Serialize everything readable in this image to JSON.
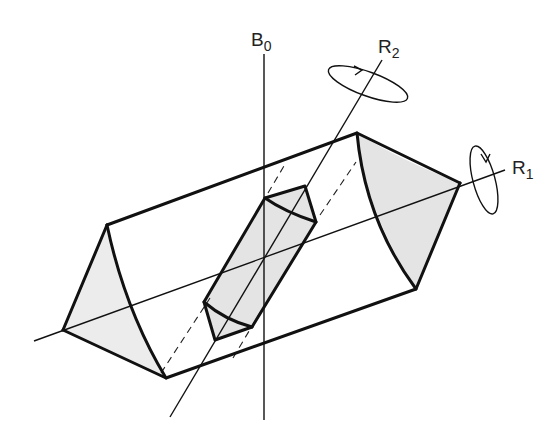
{
  "figure": {
    "labels": {
      "b0": {
        "main": "B",
        "sub": "0"
      },
      "r1": {
        "main": "R",
        "sub": "1"
      },
      "r2": {
        "main": "R",
        "sub": "2"
      }
    },
    "colors": {
      "line": "#111111",
      "shading": "#e4e4e4",
      "background": "#ffffff"
    }
  }
}
